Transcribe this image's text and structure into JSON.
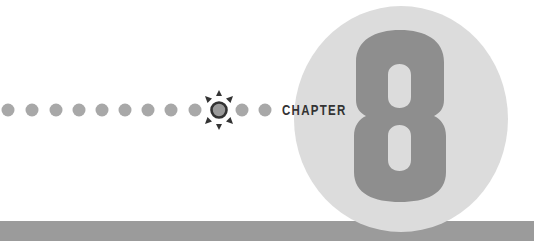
{
  "chapter": {
    "label": "CHAPTER",
    "number": "8"
  },
  "decoration": {
    "dots_before_marker": 9,
    "dots_after_marker": 2,
    "dot_centers_x": [
      8,
      32,
      56,
      79,
      102,
      125,
      148,
      171,
      195
    ],
    "marker_center_x": 219,
    "dots_after_centers_x": [
      242,
      265
    ],
    "row_center_y": 110,
    "marker_icon": "sunburst-ring-icon"
  },
  "colors": {
    "background": "#ffffff",
    "dot": "#a8a8a8",
    "marker_ring_outline": "#333333",
    "marker_ring_fill": "#9a9a9a",
    "marker_rays": "#333333",
    "chapter_text": "#333333",
    "circle": "#dcdcdc",
    "numeral": "#8e8e8e",
    "bottom_bar": "#9b9b9b"
  }
}
